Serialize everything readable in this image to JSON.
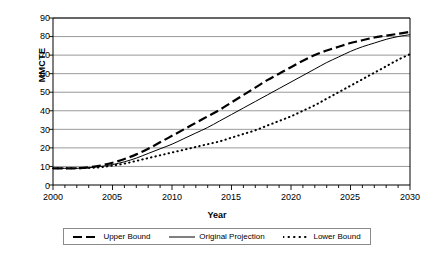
{
  "chart_data": {
    "type": "line",
    "title": "",
    "xlabel": "Year",
    "ylabel": "MMCTE",
    "xlim": [
      2000,
      2030
    ],
    "ylim": [
      0,
      90
    ],
    "xticks": [
      2000,
      2005,
      2010,
      2015,
      2020,
      2025,
      2030
    ],
    "yticks": [
      0,
      10,
      20,
      30,
      40,
      50,
      60,
      70,
      80,
      90
    ],
    "minor_xtick_interval": 1,
    "grid": "horizontal",
    "legend_position": "bottom",
    "x": [
      2000,
      2001,
      2002,
      2003,
      2004,
      2005,
      2006,
      2007,
      2008,
      2009,
      2010,
      2011,
      2012,
      2013,
      2014,
      2015,
      2016,
      2017,
      2018,
      2019,
      2020,
      2021,
      2022,
      2023,
      2024,
      2025,
      2026,
      2027,
      2028,
      2029,
      2030
    ],
    "series": [
      {
        "name": "Upper Bound",
        "style": "dashed",
        "values": [
          9,
          9,
          9,
          9.5,
          10.5,
          12,
          14,
          16.5,
          19.5,
          23,
          26.5,
          30,
          33.5,
          37,
          40.5,
          44.5,
          48.5,
          52.5,
          56.5,
          60,
          63.5,
          67,
          70,
          72.5,
          74.5,
          76.5,
          78,
          79.5,
          80.5,
          81.5,
          82.5
        ]
      },
      {
        "name": "Original Projection",
        "style": "solid",
        "values": [
          9,
          9,
          9,
          9.3,
          10,
          11,
          12.5,
          14.5,
          17,
          19.5,
          22,
          25,
          28,
          31,
          34.5,
          38,
          41.5,
          45,
          48.5,
          52,
          55.5,
          59,
          62.5,
          66,
          69,
          72,
          74.5,
          76.5,
          78.5,
          80,
          81
        ]
      },
      {
        "name": "Lower Bound",
        "style": "dotted",
        "values": [
          9,
          9,
          9,
          9.2,
          9.6,
          10.5,
          11.5,
          13,
          14.5,
          16,
          17.5,
          19,
          20.5,
          22,
          23.5,
          25.5,
          27.5,
          29.5,
          32,
          34.5,
          37,
          40,
          43,
          46.5,
          50,
          53.5,
          57,
          60.5,
          64,
          67.5,
          70.5
        ]
      }
    ]
  },
  "axis": {
    "ylabel": "MMCTE",
    "xlabel": "Year",
    "yticks": [
      "90",
      "80",
      "70",
      "60",
      "50",
      "40",
      "30",
      "20",
      "10",
      "0"
    ],
    "xticks": [
      "2000",
      "2005",
      "2010",
      "2015",
      "2020",
      "2025",
      "2030"
    ]
  },
  "legend": {
    "items": [
      {
        "label": "Upper Bound",
        "style": "dashed"
      },
      {
        "label": "Original Projection",
        "style": "solid"
      },
      {
        "label": "Lower Bound",
        "style": "dotted"
      }
    ]
  },
  "colors": {
    "line": "#000000",
    "grid": "#7f7f7f",
    "axis": "#000000",
    "background": "#ffffff"
  }
}
